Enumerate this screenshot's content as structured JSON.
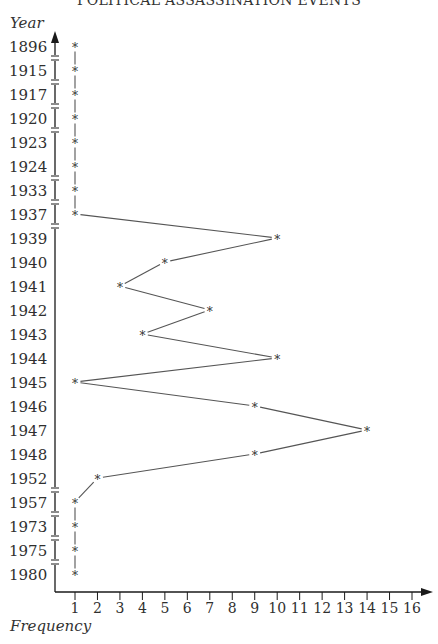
{
  "chart_data": {
    "type": "line",
    "title": "POLITICAL ASSASSINATION EVENTS",
    "ylabel": "Year",
    "xlabel": "Frequency",
    "orientation": "horizontal-values",
    "categories": [
      "1896",
      "1915",
      "1917",
      "1920",
      "1923",
      "1924",
      "1933",
      "1937",
      "1939",
      "1940",
      "1941",
      "1942",
      "1943",
      "1944",
      "1945",
      "1946",
      "1947",
      "1948",
      "1952",
      "1957",
      "1973",
      "1975",
      "1980"
    ],
    "values": [
      1,
      1,
      1,
      1,
      1,
      1,
      1,
      1,
      10,
      5,
      3,
      7,
      4,
      10,
      1,
      9,
      14,
      9,
      2,
      1,
      1,
      1,
      1
    ],
    "axis_breaks_after": [
      "1896",
      "1915",
      "1917",
      "1920",
      "1924",
      "1933",
      "1937",
      "1952",
      "1957",
      "1973",
      "1975"
    ],
    "x_ticks": [
      1,
      2,
      3,
      4,
      5,
      6,
      7,
      8,
      9,
      10,
      11,
      12,
      13,
      14,
      15,
      16
    ],
    "xlim": [
      0,
      16.5
    ],
    "marker": "*",
    "grid": false,
    "legend": null
  },
  "colors": {
    "axis": "#1a1a1a",
    "line": "#555555",
    "text": "#2f2f2f"
  }
}
